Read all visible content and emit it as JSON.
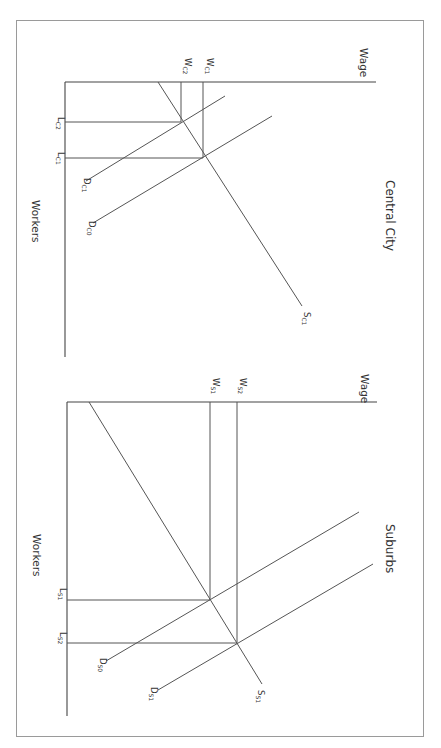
{
  "panels": [
    {
      "title": "Central City",
      "y_axis_label": "Wage",
      "x_axis_label": "Workers",
      "wage_labels": [
        {
          "main": "W",
          "sub": "C1"
        },
        {
          "main": "W",
          "sub": "C2"
        }
      ],
      "worker_labels": [
        {
          "main": "L",
          "sub": "C2"
        },
        {
          "main": "L",
          "sub": "C1"
        }
      ],
      "curve_labels": {
        "supply": {
          "main": "S",
          "sub": "C1"
        },
        "demand_0": {
          "main": "D",
          "sub": "C0"
        },
        "demand_1": {
          "main": "D",
          "sub": "C1"
        }
      }
    },
    {
      "title": "Suburbs",
      "y_axis_label": "Wage",
      "x_axis_label": "Workers",
      "wage_labels": [
        {
          "main": "W",
          "sub": "S2"
        },
        {
          "main": "W",
          "sub": "S1"
        }
      ],
      "worker_labels": [
        {
          "main": "L",
          "sub": "S1"
        },
        {
          "main": "L",
          "sub": "S2"
        }
      ],
      "curve_labels": {
        "supply": {
          "main": "S",
          "sub": "S1"
        },
        "demand_0": {
          "main": "D",
          "sub": "S0"
        },
        "demand_1": {
          "main": "D",
          "sub": "S1"
        }
      }
    }
  ],
  "colors": {
    "line": "#555555",
    "border": "#9a9a9a",
    "text": "#333333",
    "background": "#ffffff"
  }
}
